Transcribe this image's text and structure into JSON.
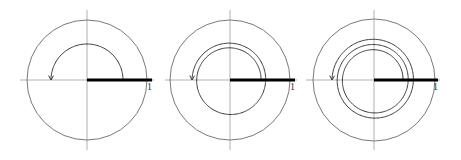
{
  "figure": {
    "colors": {
      "axis": "#b0b0b0",
      "outer_circle": "#7a7a7a",
      "spiral": "#3a3a3a",
      "thick_segment": "#000000",
      "label": "#333333"
    },
    "panels": [
      {
        "id": "panel-1",
        "center": [
          87,
          80
        ],
        "outer_radius": 60,
        "axis_extent": {
          "x_min": 20,
          "x_max": 154,
          "y_min": 10,
          "y_max": 150
        },
        "spiral": {
          "r_start": 36,
          "r_end": 36,
          "turns": 0.5
        },
        "thick_segment": {
          "x_start": 87,
          "x_end": 152
        },
        "unit_label": {
          "text": "1",
          "x": 147,
          "y": 90
        }
      },
      {
        "id": "panel-2",
        "center": [
          230,
          80
        ],
        "outer_radius": 60,
        "axis_extent": {
          "x_min": 165,
          "x_max": 297,
          "y_min": 10,
          "y_max": 150
        },
        "spiral": {
          "r_start": 31,
          "r_end": 38,
          "turns": 1.5
        },
        "thick_segment": {
          "x_start": 230,
          "x_end": 295
        },
        "unit_label": {
          "text": "1",
          "x": 290,
          "y": 90
        }
      },
      {
        "id": "panel-3",
        "center": [
          374,
          80
        ],
        "outer_radius": 61,
        "axis_extent": {
          "x_min": 306,
          "x_max": 440,
          "y_min": 10,
          "y_max": 150
        },
        "spiral": {
          "r_start": 29,
          "r_end": 42,
          "turns": 2.5
        },
        "thick_segment": {
          "x_start": 374,
          "x_end": 438
        },
        "unit_label": {
          "text": "1",
          "x": 433,
          "y": 90
        }
      }
    ]
  }
}
